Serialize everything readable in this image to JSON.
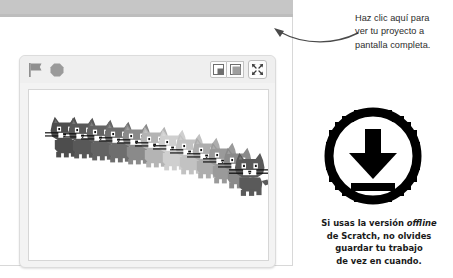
{
  "window": {
    "top_bar_color": "#c6c6c6",
    "frame_background": "#ffffff"
  },
  "stage": {
    "panel_background": "#efefef",
    "canvas_background": "#ffffff",
    "green_flag_label": "Bandera verde",
    "stop_label": "Detener",
    "controls": [
      {
        "name": "small-stage-layout",
        "label": "Diseño de escenario pequeño"
      },
      {
        "name": "normal-stage-layout",
        "label": "Diseño de escenario normal"
      },
      {
        "name": "fullscreen",
        "label": "Pantalla completa"
      }
    ],
    "sprites": {
      "name": "scratch-cat",
      "count": 12,
      "arrangement": "arco descendente con estela de transparencia",
      "shades": [
        "#4d4d4d",
        "#585858",
        "#636363",
        "#6e6e6e",
        "#8a8a8a",
        "#a5a5a5",
        "#c0c0c0",
        "#d2d2d2",
        "#bdbdbd",
        "#a8a8a8",
        "#8f8f8f",
        "#5a5a5a"
      ]
    }
  },
  "annotations": {
    "pointer_note": {
      "lines": [
        "Haz clic aquí para",
        "ver tu proyecto a",
        "pantalla completa."
      ]
    },
    "download_icon": {
      "name": "download-icon",
      "color": "#000000"
    },
    "offline_note": {
      "line1_pre": "Si usas la versión ",
      "line1_italic": "offline",
      "line2": "de Scratch, no olvides",
      "line3": "guardar tu trabajo",
      "line4": "de vez en cuando."
    }
  }
}
